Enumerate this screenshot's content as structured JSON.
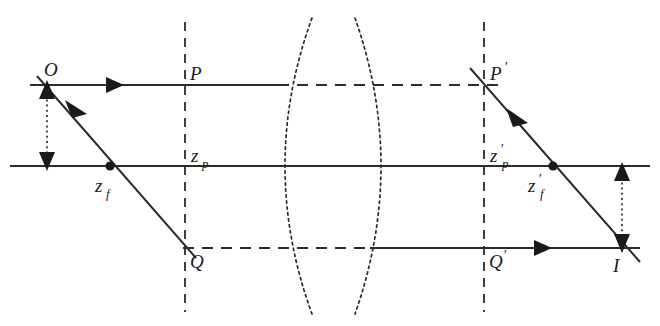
{
  "figure": {
    "width": 660,
    "height": 326,
    "background": "#ffffff",
    "ink_color": "#2b2b2b"
  },
  "labels": {
    "object_point": "O",
    "principal_point_left": "P",
    "principal_point_right": "P′",
    "principal_plane_left": "z_p",
    "principal_plane_right": "z′_p",
    "focal_point_left": "z_f",
    "focal_point_right": "z′_f",
    "lower_ray_left": "Q",
    "lower_ray_right": "Q′",
    "image_point": "I",
    "zp_base": "z",
    "zp_sub": "p",
    "zf_base": "z",
    "zf_sub": "f",
    "prime_mark": "′"
  },
  "geometry": {
    "optical_axis": {
      "x1": 10,
      "y1": 166,
      "x2": 650,
      "y2": 166
    },
    "upper_ray_solid": {
      "x1": 30,
      "y1": 85,
      "x2": 278,
      "y2": 85
    },
    "upper_ray_dashed": {
      "x1": 278,
      "y1": 85,
      "x2": 500,
      "y2": 85
    },
    "lower_ray_dashed": {
      "x1": 185,
      "y1": 248,
      "x2": 372,
      "y2": 248
    },
    "lower_ray_solid": {
      "x1": 372,
      "y1": 248,
      "x2": 640,
      "y2": 248
    },
    "oblique_ray_left": {
      "x1": 37,
      "y1": 78,
      "x2": 195,
      "y2": 258
    },
    "oblique_ray_right": {
      "x1": 474,
      "y1": 70,
      "x2": 640,
      "y2": 260
    },
    "principal_plane_left": {
      "x": 185,
      "y1": 22,
      "y2": 312
    },
    "principal_plane_right": {
      "x": 484,
      "y1": 22,
      "y2": 312
    },
    "lens_left_arc": {
      "cx": 270,
      "cy": 166,
      "top_x": 312,
      "top_y": 18,
      "bottom_x": 312,
      "bottom_y": 314
    },
    "lens_right_arc": {
      "cx": 395,
      "cy": 166,
      "top_x": 355,
      "top_y": 18,
      "bottom_x": 355,
      "bottom_y": 314
    },
    "object_arrow": {
      "x": 47,
      "y_top": 85,
      "y_bottom": 166
    },
    "image_arrow": {
      "x": 622,
      "y_top": 166,
      "y_bottom": 248
    },
    "focal_dot_left": {
      "cx": 110,
      "cy": 166,
      "r": 4.6
    },
    "focal_dot_right": {
      "cx": 553,
      "cy": 166,
      "r": 4.6
    },
    "ray_arrow_upper": {
      "x": 115,
      "y": 85
    },
    "ray_arrow_oblique_left": {
      "x": 78,
      "y": 112
    },
    "ray_arrow_oblique_right": {
      "x": 520,
      "y": 121
    },
    "ray_arrow_lower": {
      "x": 543,
      "y": 248
    }
  }
}
